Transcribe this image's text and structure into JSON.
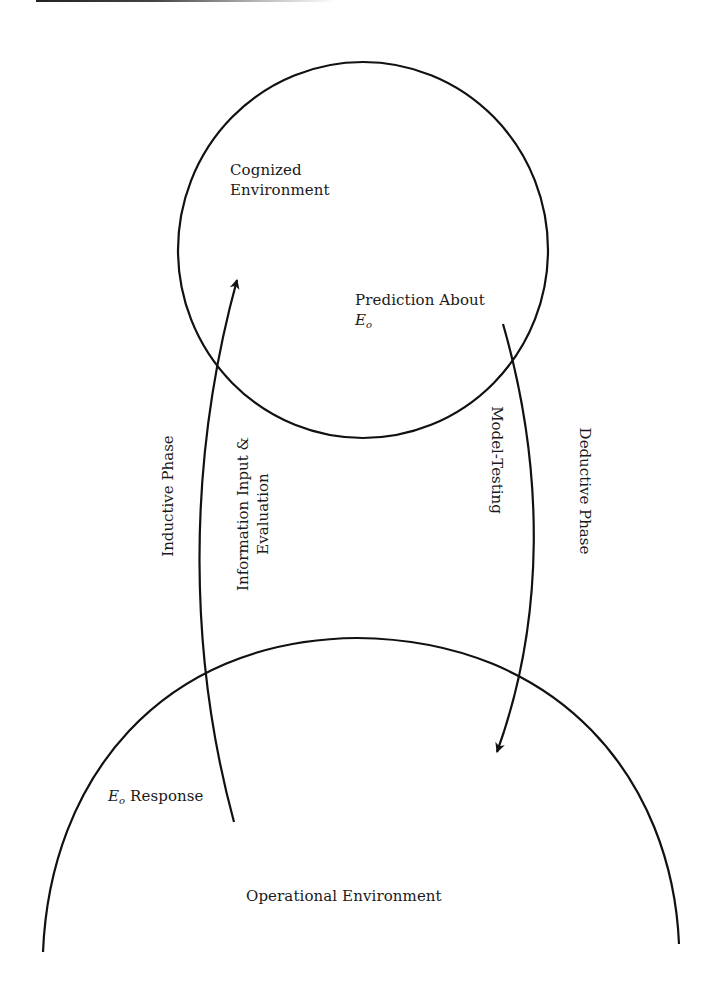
{
  "diagram": {
    "type": "cyclic-process",
    "nodes": {
      "cognized_environment": {
        "label_line1": "Cognized",
        "label_line2": "Environment"
      },
      "prediction": {
        "label_line1": "Prediction About",
        "symbol": "E",
        "subscript": "o"
      },
      "eo_response": {
        "symbol": "E",
        "subscript": "o",
        "label": "Response"
      },
      "operational_environment": {
        "label": "Operational Environment"
      }
    },
    "edges": {
      "inductive": {
        "from": "Operational Environment",
        "to": "Cognized Environment",
        "direction": "up",
        "phase_label": "Inductive Phase",
        "process_label_line1": "Information Input &",
        "process_label_line2": "Evaluation"
      },
      "deductive": {
        "from": "Cognized Environment",
        "to": "Operational Environment",
        "direction": "down",
        "phase_label": "Deductive Phase",
        "process_label": "Model-Testing"
      }
    },
    "colors": {
      "stroke": "#111111",
      "text": "#1a1a1a",
      "background": "#ffffff"
    }
  }
}
